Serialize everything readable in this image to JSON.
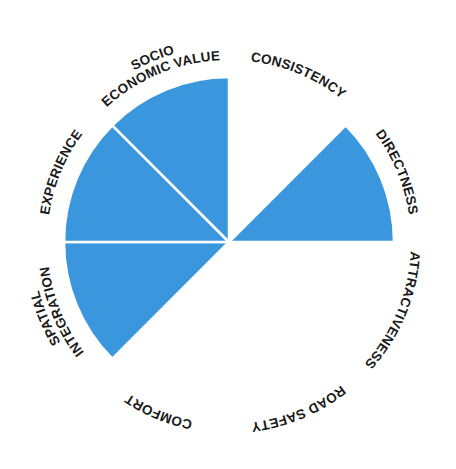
{
  "chart_data": {
    "type": "polar-area",
    "title": "",
    "center": [
      229,
      242
    ],
    "max_radius": 165,
    "fill_color": "#3b97dd",
    "separator_color": "#ffffff",
    "categories": [
      "CONSISTENCY",
      "DIRECTNESS",
      "ATTRACTIVENESS",
      "ROAD SAFETY",
      "COMFORT",
      "SPATIAL INTEGRATION",
      "EXPERIENCE",
      "SOCIO ECONOMIC VALUE"
    ],
    "values": [
      0,
      1,
      0,
      0,
      0,
      1,
      1,
      1
    ],
    "value_range": [
      0,
      1
    ],
    "segments": [
      {
        "label": "CONSISTENCY",
        "lines": [
          "CONSISTENCY"
        ],
        "value": 0
      },
      {
        "label": "DIRECTNESS",
        "lines": [
          "DIRECTNESS"
        ],
        "value": 1
      },
      {
        "label": "ATTRACTIVENESS",
        "lines": [
          "ATTRACTIVENESS"
        ],
        "value": 0
      },
      {
        "label": "ROAD SAFETY",
        "lines": [
          "ROAD SAFETY"
        ],
        "value": 0
      },
      {
        "label": "COMFORT",
        "lines": [
          "COMFORT"
        ],
        "value": 0
      },
      {
        "label": "SPATIAL INTEGRATION",
        "lines": [
          "SPATIAL",
          "INTEGRATION"
        ],
        "value": 1
      },
      {
        "label": "EXPERIENCE",
        "lines": [
          "EXPERIENCE"
        ],
        "value": 1
      },
      {
        "label": "SOCIO ECONOMIC VALUE",
        "lines": [
          "SOCIO",
          "ECONOMIC VALUE"
        ],
        "value": 1
      }
    ],
    "legend": null,
    "grid": false
  }
}
